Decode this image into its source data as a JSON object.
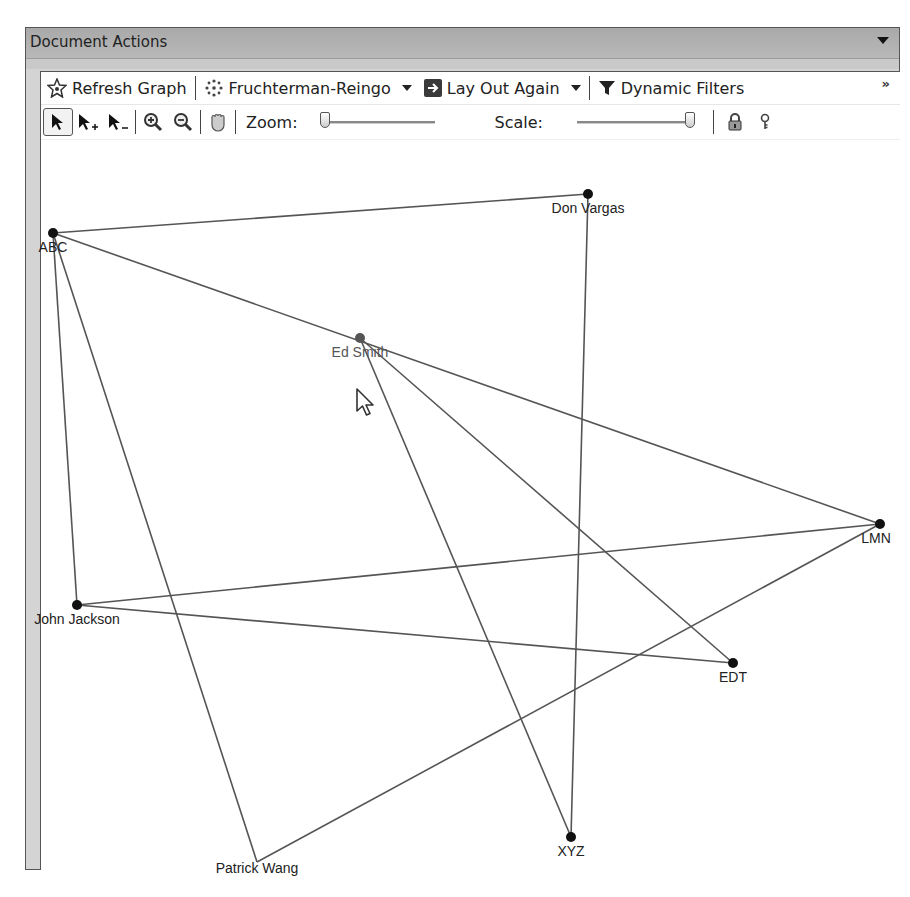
{
  "panel": {
    "title": "Document Actions"
  },
  "toolbar1": {
    "refresh_label": "Refresh Graph",
    "layout_algorithm": "Fruchterman-Reingo",
    "layout_again_label": "Lay Out Again",
    "filters_label": "Dynamic Filters",
    "overflow_label": "»"
  },
  "toolbar2": {
    "zoom_label": "Zoom:",
    "zoom_value_percent": 0,
    "scale_label": "Scale:",
    "scale_value_percent": 100
  },
  "graph": {
    "nodes": [
      {
        "id": "ABC",
        "label": "ABC",
        "x": 53,
        "y": 233
      },
      {
        "id": "DonVargas",
        "label": "Don Vargas",
        "x": 588,
        "y": 194
      },
      {
        "id": "EdSmith",
        "label": "Ed Smith",
        "x": 360,
        "y": 338
      },
      {
        "id": "LMN",
        "label": "LMN",
        "x": 880,
        "y": 524
      },
      {
        "id": "JohnJackson",
        "label": "John Jackson",
        "x": 77,
        "y": 605
      },
      {
        "id": "EDT",
        "label": "EDT",
        "x": 733,
        "y": 663
      },
      {
        "id": "PatrickWang",
        "label": "Patrick Wang",
        "x": 257,
        "y": 862
      },
      {
        "id": "XYZ",
        "label": "XYZ",
        "x": 571,
        "y": 837
      }
    ],
    "edges": [
      [
        "ABC",
        "DonVargas"
      ],
      [
        "ABC",
        "LMN"
      ],
      [
        "ABC",
        "JohnJackson"
      ],
      [
        "ABC",
        "PatrickWang"
      ],
      [
        "DonVargas",
        "XYZ"
      ],
      [
        "EdSmith",
        "XYZ"
      ],
      [
        "EdSmith",
        "EDT"
      ],
      [
        "JohnJackson",
        "LMN"
      ],
      [
        "JohnJackson",
        "EDT"
      ],
      [
        "LMN",
        "PatrickWang"
      ]
    ],
    "edge_color": "#555555",
    "node_color": "#111111"
  }
}
